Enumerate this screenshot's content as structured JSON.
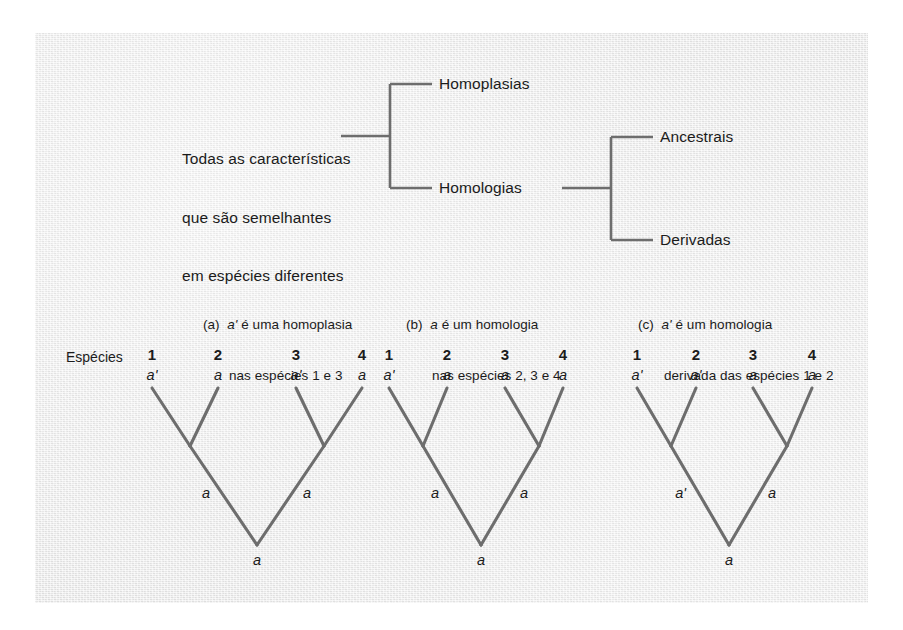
{
  "figure": {
    "background_color": "#e9e9e9",
    "line_color": "#6d6d6d",
    "text_color": "#1b1b1b"
  },
  "hierarchy": {
    "root_label_lines": [
      "Todas as características",
      "que são semelhantes",
      "em espécies diferentes"
    ],
    "branch_1": "Homoplasias",
    "branch_2": "Homologias",
    "sub_branch_1": "Ancestrais",
    "sub_branch_2": "Derivadas"
  },
  "species_label": "Espécies",
  "panels": [
    {
      "tag": "(a)",
      "caption_line1_italic": "a'",
      "caption_line1_rest": " é uma homoplasia",
      "caption_line2": "nas espécies 1 e 3",
      "tips": [
        {
          "number": "1",
          "state": "a'"
        },
        {
          "number": "2",
          "state": "a"
        },
        {
          "number": "3",
          "state": "a'"
        },
        {
          "number": "4",
          "state": "a"
        }
      ],
      "internal_left": "a",
      "internal_right": "a",
      "root_state": "a"
    },
    {
      "tag": "(b)",
      "caption_line1_italic": "a",
      "caption_line1_rest": " é um homologia",
      "caption_line2": "nas espécies 2, 3 e 4",
      "tips": [
        {
          "number": "1",
          "state": "a'"
        },
        {
          "number": "2",
          "state": "a"
        },
        {
          "number": "3",
          "state": "a"
        },
        {
          "number": "4",
          "state": "a"
        }
      ],
      "internal_left": "a",
      "internal_right": "a",
      "root_state": "a"
    },
    {
      "tag": "(c)",
      "caption_line1_italic": "a'",
      "caption_line1_rest": " é um homologia",
      "caption_line2": "derivada das espécies 1 e 2",
      "tips": [
        {
          "number": "1",
          "state": "a'"
        },
        {
          "number": "2",
          "state": "a'"
        },
        {
          "number": "3",
          "state": "a"
        },
        {
          "number": "4",
          "state": "a"
        }
      ],
      "internal_left": "a'",
      "internal_right": "a",
      "root_state": "a"
    }
  ]
}
